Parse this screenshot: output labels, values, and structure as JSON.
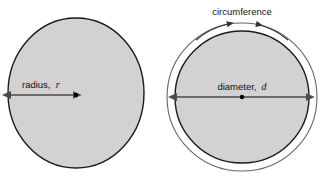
{
  "figure": {
    "background_color": "#ffffff"
  },
  "colors": {
    "fill": "#d2d2d2",
    "outline": "#1a1a1a",
    "ring_fill": "#ffffff",
    "ring_outline": "#555555",
    "arrow": "#4a4a4a",
    "text": "#111111",
    "dot": "#000000"
  },
  "left_circle": {
    "name": "radius-circle",
    "center": {
      "x": 76,
      "y": 93
    },
    "radius_x": 68,
    "radius_y": 75,
    "label_text": "radius,",
    "label_variable": "r",
    "label_position": {
      "x": 22,
      "y": 88
    },
    "arrow": {
      "name": "radius-arrow",
      "from": {
        "x": 10,
        "y": 95
      },
      "to": {
        "x": 76,
        "y": 95
      },
      "double_headed": true
    },
    "center_dot": {
      "x": 76,
      "y": 95,
      "r": 2.2
    }
  },
  "right_circle": {
    "name": "diameter-circle",
    "center": {
      "x": 242,
      "y": 97
    },
    "radius_x": 67,
    "radius_y": 66,
    "outer_ring": {
      "name": "circumference-ring",
      "radius_x": 75,
      "radius_y": 74
    },
    "label_text": "diameter,",
    "label_variable": "d",
    "label_position": {
      "x": 208,
      "y": 92
    },
    "arrow": {
      "name": "diameter-arrow",
      "from": {
        "x": 176,
        "y": 97
      },
      "to": {
        "x": 308,
        "y": 97
      },
      "double_headed": true
    },
    "center_dot": {
      "x": 242,
      "y": 97,
      "r": 2.2
    },
    "circumference_label": {
      "name": "circumference-label",
      "text": "circumference",
      "position": {
        "x": 242,
        "y": 15
      }
    },
    "circumference_arrows": {
      "left_head_at": {
        "x": 229,
        "y": 24
      },
      "right_head_at": {
        "x": 253,
        "y": 24
      }
    }
  }
}
